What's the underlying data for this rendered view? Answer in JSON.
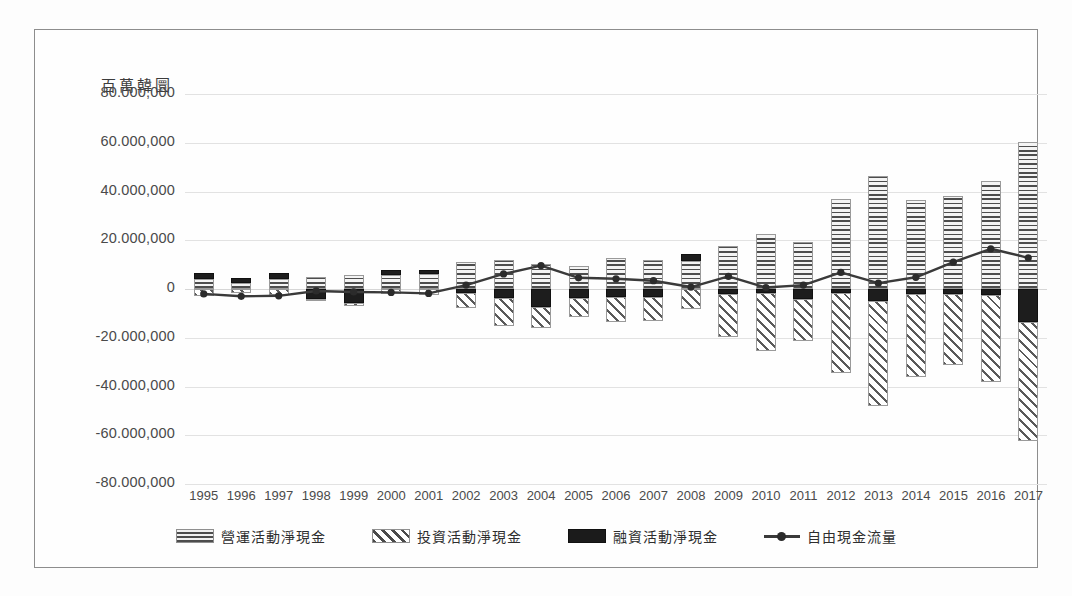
{
  "chart_data": {
    "type": "bar",
    "subtype": "stacked-bar-with-line",
    "title": "",
    "yaxis_title": "百萬韓圜",
    "xlabel": "",
    "ylabel": "百萬韓圜",
    "ylim": [
      -80000000,
      80000000
    ],
    "ytick_step": 20000000,
    "ytick_labels": [
      "80.000,000",
      "60.000,000",
      "40.000,000",
      "20.000,000",
      "0",
      "-20.000,000",
      "-40.000,000",
      "-60.000,000",
      "-80.000,000"
    ],
    "ytick_values": [
      80000000,
      60000000,
      40000000,
      20000000,
      0,
      -20000000,
      -40000000,
      -60000000,
      -80000000
    ],
    "grid": true,
    "legend_position": "bottom",
    "categories": [
      "1995",
      "1996",
      "1997",
      "1998",
      "1999",
      "2000",
      "2001",
      "2002",
      "2003",
      "2004",
      "2005",
      "2006",
      "2007",
      "2008",
      "2009",
      "2010",
      "2011",
      "2012",
      "2013",
      "2014",
      "2015",
      "2016",
      "2017"
    ],
    "series": [
      {
        "name": "營運活動淨現金",
        "key": "operating",
        "pattern": "horizontal-lines",
        "color": "#efefef",
        "values": [
          4200000,
          2600000,
          4000000,
          4800000,
          5800000,
          5600000,
          6000000,
          11200000,
          12000000,
          10200000,
          9500000,
          12600000,
          11800000,
          11400000,
          17800000,
          22600000,
          19200000,
          37000000,
          46500000,
          36500000,
          38000000,
          44500000,
          60500000
        ]
      },
      {
        "name": "投資活動淨現金",
        "key": "investing",
        "pattern": "diagonal-hatch",
        "color": "#ffffff",
        "values": [
          -2800000,
          -1800000,
          -2400000,
          -1000000,
          -1200000,
          -2000000,
          -2600000,
          -6000000,
          -11200000,
          -8600000,
          -7800000,
          -10200000,
          -9800000,
          -8400000,
          -17400000,
          -23800000,
          -17000000,
          -33000000,
          -43200000,
          -34000000,
          -29000000,
          -35800000,
          -49000000
        ]
      },
      {
        "name": "融資活動淨現金",
        "key": "financing",
        "pattern": "solid",
        "color": "#1d1d1d",
        "values": [
          2200000,
          1800000,
          2400000,
          -4000000,
          -5600000,
          2200000,
          2000000,
          -1600000,
          -3800000,
          -7400000,
          -3600000,
          -3200000,
          -3200000,
          3000000,
          -2200000,
          -1600000,
          -4200000,
          -1500000,
          -4800000,
          -2000000,
          -2200000,
          -2400000,
          -13500000
        ]
      }
    ],
    "line_series": {
      "name": "自由現金流量",
      "key": "free_cash_flow",
      "marker": "circle",
      "color": "#3a3a3a",
      "values": [
        -2000000,
        -3000000,
        -2800000,
        -800000,
        -1200000,
        -1400000,
        -1800000,
        1600000,
        6200000,
        9600000,
        4600000,
        4200000,
        3400000,
        800000,
        5200000,
        600000,
        1600000,
        6800000,
        2400000,
        4800000,
        11000000,
        16500000,
        12800000
      ]
    },
    "legend": [
      {
        "label": "營運活動淨現金",
        "swatch": "operating"
      },
      {
        "label": "投資活動淨現金",
        "swatch": "investing"
      },
      {
        "label": "融資活動淨現金",
        "swatch": "financing"
      },
      {
        "label": "自由現金流量",
        "swatch": "free-cash-flow-line"
      }
    ]
  }
}
